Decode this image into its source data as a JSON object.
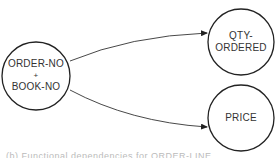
{
  "diagram": {
    "type": "functional-dependency",
    "nodes": [
      {
        "id": "key",
        "lines": [
          "ORDER-NO",
          "+",
          "BOOK-NO"
        ],
        "cx": 36,
        "cy": 76,
        "r": 34
      },
      {
        "id": "qty",
        "lines": [
          "QTY-",
          "ORDERED"
        ],
        "cx": 241,
        "cy": 42,
        "r": 33
      },
      {
        "id": "price",
        "lines": [
          "PRICE"
        ],
        "cx": 241,
        "cy": 118,
        "r": 33
      }
    ],
    "edges": [
      {
        "from": "key",
        "to": "qty"
      },
      {
        "from": "key",
        "to": "price"
      }
    ],
    "stroke_color": "#222222",
    "text_color": "#333333"
  },
  "caption": {
    "text": "(b) Functional dependencies for ORDER-LINE"
  }
}
